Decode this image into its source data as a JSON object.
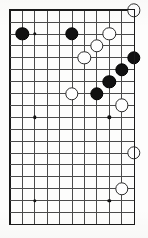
{
  "diagram": {
    "kind": "go-board-diagram",
    "game": "Go",
    "board": {
      "columns": 11,
      "rows": 19,
      "origin_x": 10.0,
      "origin_y": 10.2,
      "spacing_x": 12.4,
      "spacing_y": 11.9,
      "line_color": "#4a4a4a",
      "border_color": "#1a1a1a",
      "background_color": "#fdfdfc",
      "partial_view": true
    },
    "star_points": [
      {
        "col": 3,
        "row": 3
      },
      {
        "col": 3,
        "row": 10
      },
      {
        "col": 9,
        "row": 3
      },
      {
        "col": 9,
        "row": 10
      },
      {
        "col": 3,
        "row": 17
      },
      {
        "col": 9,
        "row": 17
      }
    ],
    "stone_style": {
      "black_fill": "#111111",
      "white_fill": "#fefefe",
      "white_outline": "#2b2b2b",
      "diameter": 13.4
    },
    "stones": [
      {
        "color": "black",
        "col": 2,
        "row": 3,
        "label": ""
      },
      {
        "color": "black",
        "col": 6,
        "row": 3,
        "label": ""
      },
      {
        "color": "black",
        "col": 11,
        "row": 5,
        "label": ""
      },
      {
        "color": "black",
        "col": 10,
        "row": 6,
        "label": ""
      },
      {
        "color": "black",
        "col": 9,
        "row": 7,
        "label": ""
      },
      {
        "color": "black",
        "col": 8,
        "row": 8,
        "label": ""
      },
      {
        "color": "white",
        "col": 11,
        "row": 1,
        "label": ""
      },
      {
        "color": "white",
        "col": 9,
        "row": 3,
        "label": ""
      },
      {
        "color": "white",
        "col": 8,
        "row": 4,
        "label": ""
      },
      {
        "color": "white",
        "col": 7,
        "row": 5,
        "label": ""
      },
      {
        "color": "white",
        "col": 6,
        "row": 8,
        "label": ""
      },
      {
        "color": "white",
        "col": 10,
        "row": 9,
        "label": ""
      },
      {
        "color": "white",
        "col": 11,
        "row": 13,
        "label": ""
      },
      {
        "color": "white",
        "col": 10,
        "row": 16,
        "label": ""
      }
    ],
    "counts": {
      "black_stones": 6,
      "white_stones": 8,
      "total_stones": 14
    }
  }
}
